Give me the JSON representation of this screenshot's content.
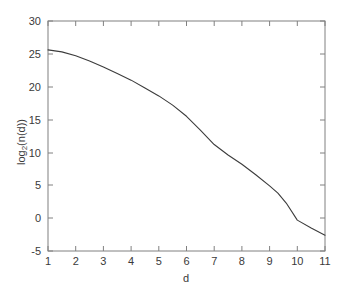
{
  "chart_data": {
    "type": "line",
    "title": "",
    "xlabel": "d",
    "ylabel": "log2(n(d))",
    "ylabel_base": "log",
    "ylabel_sub": "2",
    "ylabel_rest": "(n(d))",
    "xlim": [
      1,
      11
    ],
    "ylim": [
      -5,
      30
    ],
    "grid": false,
    "legend": "none",
    "line_color": "#3c3c3c",
    "axis_color": "#808080",
    "background": "#ffffff",
    "xticks": [
      1,
      2,
      3,
      4,
      5,
      6,
      7,
      8,
      9,
      10,
      11
    ],
    "xtick_labels": [
      "1",
      "2",
      "3",
      "4",
      "5",
      "6",
      "7",
      "8",
      "9",
      "10",
      "11"
    ],
    "yticks": [
      -5,
      0,
      5,
      10,
      15,
      20,
      25,
      30
    ],
    "ytick_labels": [
      "-5",
      "0",
      "5",
      "10",
      "15",
      "20",
      "25",
      "30"
    ],
    "series": [
      {
        "name": "log2(n(d))",
        "x": [
          1,
          1.5,
          2,
          2.5,
          3,
          3.5,
          4,
          4.5,
          5,
          5.5,
          6,
          6.5,
          7,
          7.5,
          8,
          8.5,
          9,
          9.3,
          9.6,
          10,
          10.5,
          11
        ],
        "values": [
          25.6,
          25.3,
          24.7,
          23.9,
          23.0,
          22.0,
          21.0,
          19.8,
          18.6,
          17.2,
          15.5,
          13.4,
          11.2,
          9.6,
          8.2,
          6.6,
          4.9,
          3.8,
          2.3,
          -0.3,
          -1.5,
          -2.6
        ]
      }
    ]
  }
}
